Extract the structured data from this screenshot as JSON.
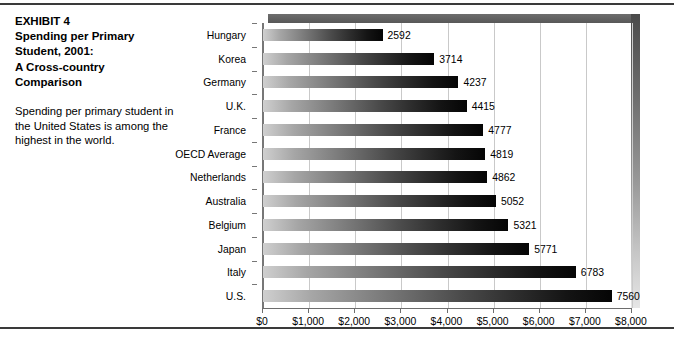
{
  "exhibit": {
    "title_lines": [
      "EXHIBIT 4",
      "Spending per Primary",
      "Student, 2001:",
      "A Cross-country",
      "Comparison"
    ],
    "title_text": "EXHIBIT 4\nSpending per Primary\nStudent, 2001:\nA Cross-country\nComparison",
    "description": "Spending per primary student in the United States is among the highest in the world."
  },
  "chart_data": {
    "type": "bar",
    "orientation": "horizontal",
    "title": "Spending per Primary Student, 2001: A Cross-country Comparison",
    "xlabel": "",
    "ylabel": "",
    "xlim": [
      0,
      8000
    ],
    "grid": true,
    "legend": false,
    "categories": [
      "Hungary",
      "Korea",
      "Germany",
      "U.K.",
      "France",
      "OECD Average",
      "Netherlands",
      "Australia",
      "Belgium",
      "Japan",
      "Italy",
      "U.S."
    ],
    "values": [
      2592,
      3714,
      4237,
      4415,
      4777,
      4819,
      4862,
      5052,
      5321,
      5771,
      6783,
      7560
    ],
    "value_labels": [
      "2592",
      "3714",
      "4237",
      "4415",
      "4777",
      "4819",
      "4862",
      "5052",
      "5321",
      "5771",
      "6783",
      "7560"
    ],
    "xticks": [
      0,
      1000,
      2000,
      3000,
      4000,
      5000,
      6000,
      7000,
      8000
    ],
    "xtick_labels": [
      "$0",
      "$1,000",
      "$2,000",
      "$3,000",
      "$4,000",
      "$5,000",
      "$6,000",
      "$7,000",
      "$8,000"
    ],
    "colors": {
      "bar_gradient_start": "#cfcfcf",
      "bar_gradient_end": "#050505",
      "gridline": "#c9c9c9",
      "axis": "#6d6d6d",
      "slab_top": "#5f5f5f",
      "rule": "#3a3a3a",
      "background": "#ffffff"
    }
  }
}
